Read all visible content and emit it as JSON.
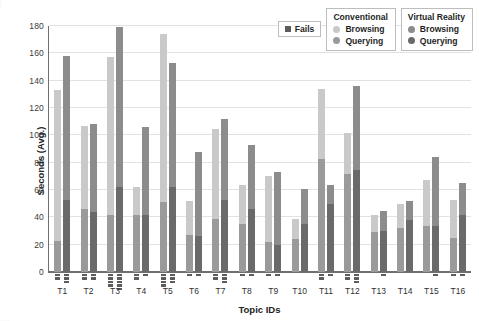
{
  "chart_data": {
    "type": "bar",
    "title": "",
    "xlabel": "Topic IDs",
    "ylabel": "Seconds (Avg.)",
    "ylim": [
      0,
      180
    ],
    "yticks": [
      0,
      20,
      40,
      60,
      80,
      100,
      120,
      140,
      160,
      180
    ],
    "grid": true,
    "stacked": true,
    "legend_position": "top-right",
    "categories": [
      "T1",
      "T2",
      "T3",
      "T4",
      "T5",
      "T6",
      "T7",
      "T8",
      "T9",
      "T10",
      "T11",
      "T12",
      "T13",
      "T14",
      "T15",
      "T16"
    ],
    "series": [
      {
        "name": "Conventional Querying",
        "color": "#9a9a9a",
        "values": [
          23,
          46,
          42,
          42,
          51,
          27,
          39,
          35,
          22,
          24,
          83,
          72,
          29,
          32,
          34,
          25
        ]
      },
      {
        "name": "Conventional Browsing",
        "color": "#c9c9c9",
        "values": [
          110,
          61,
          115,
          20,
          123,
          25,
          66,
          29,
          48,
          15,
          51,
          30,
          13,
          18,
          33,
          28
        ]
      },
      {
        "name": "Virtual Reality Querying",
        "color": "#6a6a6a",
        "values": [
          53,
          44,
          62,
          42,
          62,
          26,
          53,
          46,
          20,
          35,
          50,
          75,
          30,
          38,
          34,
          42
        ]
      },
      {
        "name": "Virtual Reality Browsing",
        "color": "#8c8c8c",
        "values": [
          105,
          64,
          117,
          64,
          91,
          62,
          59,
          47,
          53,
          26,
          14,
          61,
          15,
          14,
          50,
          23
        ]
      }
    ],
    "totals": {
      "conventional": [
        133,
        107,
        157,
        62,
        174,
        52,
        105,
        64,
        70,
        39,
        134,
        102,
        42,
        50,
        67,
        53
      ],
      "virtual_reality": [
        158,
        108,
        179,
        106,
        153,
        88,
        112,
        93,
        73,
        61,
        64,
        136,
        45,
        52,
        84,
        65
      ]
    },
    "fails": {
      "label": "Fails",
      "color": "#5c5c5c",
      "conventional": [
        2,
        2,
        4,
        2,
        4,
        1,
        2,
        1,
        1,
        0,
        2,
        2,
        0,
        0,
        0,
        1
      ],
      "virtual_reality": [
        3,
        2,
        5,
        1,
        3,
        1,
        3,
        1,
        1,
        0,
        1,
        3,
        1,
        0,
        1,
        1
      ]
    }
  },
  "legend": {
    "fails": {
      "label": "Fails"
    },
    "groups": [
      {
        "title": "Conventional",
        "items": [
          {
            "label": "Browsing",
            "color": "#c9c9c9"
          },
          {
            "label": "Querying",
            "color": "#9a9a9a"
          }
        ]
      },
      {
        "title": "Virtual Reality",
        "items": [
          {
            "label": "Browsing",
            "color": "#8c8c8c"
          },
          {
            "label": "Querying",
            "color": "#6a6a6a"
          }
        ]
      }
    ]
  }
}
